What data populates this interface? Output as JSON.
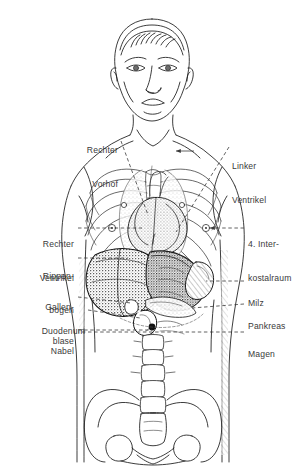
{
  "figure": {
    "kind": "anatomy-diagram",
    "view": "Frontalansicht",
    "style": "Strichzeichnung, schwarz-weiß, schraffiert",
    "line_color": "#1a1a1a",
    "label_color": "#3a3a3a",
    "background_color": "#ffffff",
    "leader_style": "gestrichelt"
  },
  "cropped_header": {
    "text": "",
    "visible": "partially cut off at top edge"
  },
  "labels_left": [
    {
      "id": "rechter-vorhof",
      "lines": [
        "Rechter",
        "Vorhof"
      ],
      "x_right": 118,
      "y_top": 122,
      "leader": "diagonal"
    },
    {
      "id": "rechter-ventrikel",
      "lines": [
        "Rechter",
        "Ventrikel"
      ],
      "x_right": 74,
      "y_top": 216,
      "leader": "dashed"
    },
    {
      "id": "rippenbogen",
      "lines": [
        "Rippen-",
        "bogen"
      ],
      "x_right": 74,
      "y_top": 248,
      "leader": "dashed"
    },
    {
      "id": "gallenblase",
      "lines": [
        "Gallen-",
        "blase"
      ],
      "x_right": 74,
      "y_top": 279,
      "leader": "dashed"
    },
    {
      "id": "duodenum",
      "lines": [
        "Duodenum"
      ],
      "x_right": 74,
      "y_top": 303,
      "leader": "dashed"
    },
    {
      "id": "nabel",
      "lines": [
        "Nabel"
      ],
      "x_right": 74,
      "y_top": 323,
      "leader": "dashed"
    }
  ],
  "labels_right": [
    {
      "id": "linker-ventrikel",
      "lines": [
        "Linker",
        "Ventrikel"
      ],
      "x_left": 232,
      "y_top": 138,
      "leader": "diagonal"
    },
    {
      "id": "interkostalraum",
      "lines": [
        "4. Inter-",
        "kostalraum"
      ],
      "x_left": 248,
      "y_top": 216,
      "leader": "dashed-arrow"
    },
    {
      "id": "milz",
      "lines": [
        "Milz"
      ],
      "x_left": 248,
      "y_top": 275,
      "leader": "dashed"
    },
    {
      "id": "pankreas",
      "lines": [
        "Pankreas"
      ],
      "x_left": 248,
      "y_top": 298,
      "leader": "dashed"
    },
    {
      "id": "magen",
      "lines": [
        "Magen"
      ],
      "x_left": 248,
      "y_top": 326,
      "leader": "dashed"
    }
  ],
  "anatomy_parts": [
    "Kopf",
    "Hals",
    "Schultern",
    "Brustkorb",
    "Rippen",
    "Sternum",
    "Herz",
    "Lunge",
    "Leber",
    "Magen",
    "Milz",
    "Pankreas",
    "Duodenum",
    "Gallenblase",
    "Nabel",
    "Wirbelsäule",
    "Becken",
    "Kreuzbein"
  ]
}
